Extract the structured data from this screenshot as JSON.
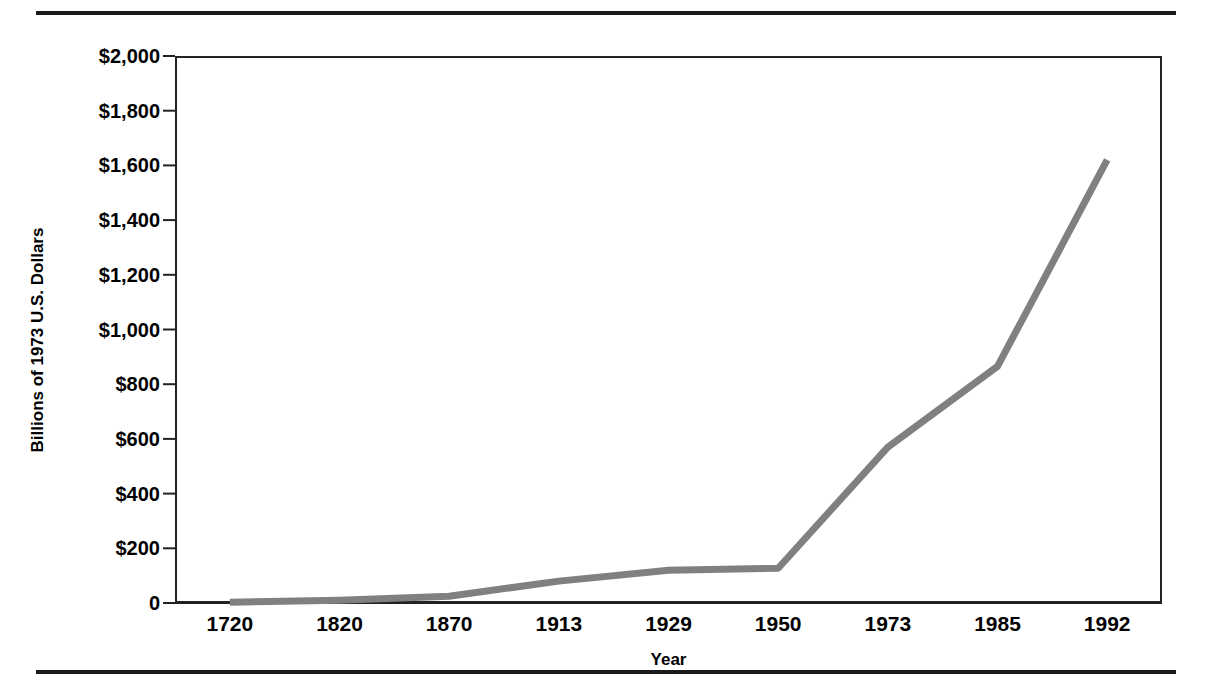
{
  "figure": {
    "top_rule": "horizontal-rule",
    "bottom_rule": "horizontal-rule"
  },
  "chart_data": {
    "type": "line",
    "title": "",
    "subtitle": "",
    "xlabel": "Year",
    "ylabel": "Billions of 1973 U.S. Dollars",
    "categories": [
      "1720",
      "1820",
      "1870",
      "1913",
      "1929",
      "1950",
      "1973",
      "1985",
      "1992"
    ],
    "values": [
      3,
      10,
      25,
      80,
      120,
      127,
      570,
      865,
      1620
    ],
    "series": [
      {
        "name": "Output",
        "values": [
          3,
          10,
          25,
          80,
          120,
          127,
          570,
          865,
          1620
        ],
        "color": "#808080"
      }
    ],
    "ylim": [
      0,
      2000
    ],
    "yticks": [
      0,
      200,
      400,
      600,
      800,
      1000,
      1200,
      1400,
      1600,
      1800,
      2000
    ],
    "ytick_labels": [
      "0",
      "$200",
      "$400",
      "$600",
      "$800",
      "$1,000",
      "$1,200",
      "$1,400",
      "$1,600",
      "$1,800",
      "$2,000"
    ],
    "xtick_labels": [
      "1720",
      "1820",
      "1870",
      "1913",
      "1929",
      "1950",
      "1973",
      "1985",
      "1992"
    ],
    "grid": false,
    "legend": false,
    "legend_position": "none",
    "line_color": "#808080",
    "line_width": 7,
    "axis_color": "#222222",
    "plot_background": "#ffffff"
  }
}
